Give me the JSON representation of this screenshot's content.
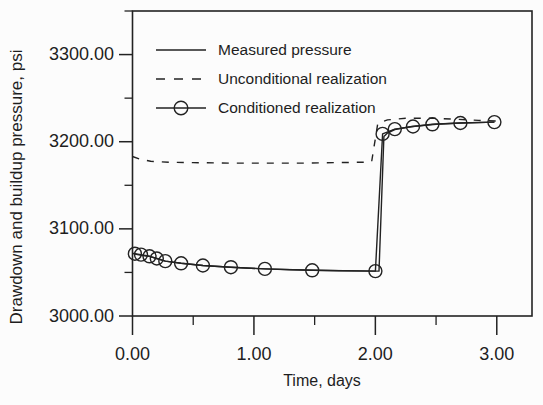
{
  "figure": {
    "background": "#fcfcfc",
    "ink": "#222222"
  },
  "chart_data": {
    "type": "line",
    "title": "",
    "xlabel": "Time, days",
    "ylabel": "Drawdown and buildup pressure, psi",
    "xlim": [
      0,
      3.29
    ],
    "ylim": [
      3000,
      3350
    ],
    "grid": false,
    "legend_position": "inside-top-left",
    "x_ticks": {
      "major": [
        {
          "value": 0,
          "label": "0.00"
        },
        {
          "value": 1,
          "label": "1.00"
        },
        {
          "value": 2,
          "label": "2.00"
        },
        {
          "value": 3,
          "label": "3.00"
        }
      ],
      "minor": [
        0.5,
        1.5,
        2.5
      ]
    },
    "y_ticks": {
      "major": [
        {
          "value": 3000,
          "label": "3000.00"
        },
        {
          "value": 3100,
          "label": "3100.00"
        },
        {
          "value": 3200,
          "label": "3200.00"
        },
        {
          "value": 3300,
          "label": "3300.00"
        }
      ],
      "minor": [
        3050,
        3150,
        3250,
        3350
      ]
    },
    "series": [
      {
        "name": "Measured pressure",
        "style": "solid",
        "marker": "none",
        "points": [
          [
            0.0,
            3072
          ],
          [
            0.04,
            3070.5
          ],
          [
            0.1,
            3069
          ],
          [
            0.14,
            3068.5
          ],
          [
            0.2,
            3066
          ],
          [
            0.27,
            3063
          ],
          [
            0.4,
            3060.5
          ],
          [
            0.58,
            3058
          ],
          [
            0.81,
            3056
          ],
          [
            1.09,
            3054
          ],
          [
            1.3,
            3053
          ],
          [
            1.7,
            3052
          ],
          [
            2.0,
            3051.5
          ],
          [
            2.03,
            3051.5
          ],
          [
            2.07,
            3206
          ],
          [
            2.1,
            3210
          ],
          [
            2.16,
            3214
          ],
          [
            2.3,
            3217.5
          ],
          [
            2.5,
            3220
          ],
          [
            2.7,
            3221.5
          ],
          [
            2.98,
            3222.5
          ]
        ]
      },
      {
        "name": "Unconditional realization",
        "style": "dashed",
        "marker": "none",
        "points": [
          [
            0.0,
            3183
          ],
          [
            0.06,
            3180
          ],
          [
            0.15,
            3177.5
          ],
          [
            0.3,
            3176.5
          ],
          [
            0.5,
            3176
          ],
          [
            0.8,
            3175.5
          ],
          [
            1.1,
            3175.5
          ],
          [
            1.4,
            3175.5
          ],
          [
            1.7,
            3176
          ],
          [
            1.9,
            3176.5
          ],
          [
            1.97,
            3177.5
          ],
          [
            2.02,
            3221
          ],
          [
            2.1,
            3225
          ],
          [
            2.25,
            3227
          ],
          [
            2.45,
            3227
          ],
          [
            2.65,
            3226
          ],
          [
            2.85,
            3224.5
          ],
          [
            3.05,
            3223.5
          ]
        ]
      },
      {
        "name": "Conditioned realization",
        "style": "solid",
        "marker": "circle",
        "points": [
          [
            0.02,
            3071.5
          ],
          [
            0.07,
            3070.5
          ],
          [
            0.14,
            3068.5
          ],
          [
            0.2,
            3066
          ],
          [
            0.27,
            3063
          ],
          [
            0.4,
            3060.5
          ],
          [
            0.58,
            3058
          ],
          [
            0.81,
            3056
          ],
          [
            1.09,
            3054
          ],
          [
            1.48,
            3052.5
          ],
          [
            2.0,
            3051.5
          ],
          [
            2.06,
            3209
          ],
          [
            2.16,
            3214.5
          ],
          [
            2.31,
            3217.5
          ],
          [
            2.47,
            3220
          ],
          [
            2.7,
            3221.5
          ],
          [
            2.98,
            3222.5
          ]
        ]
      }
    ]
  }
}
